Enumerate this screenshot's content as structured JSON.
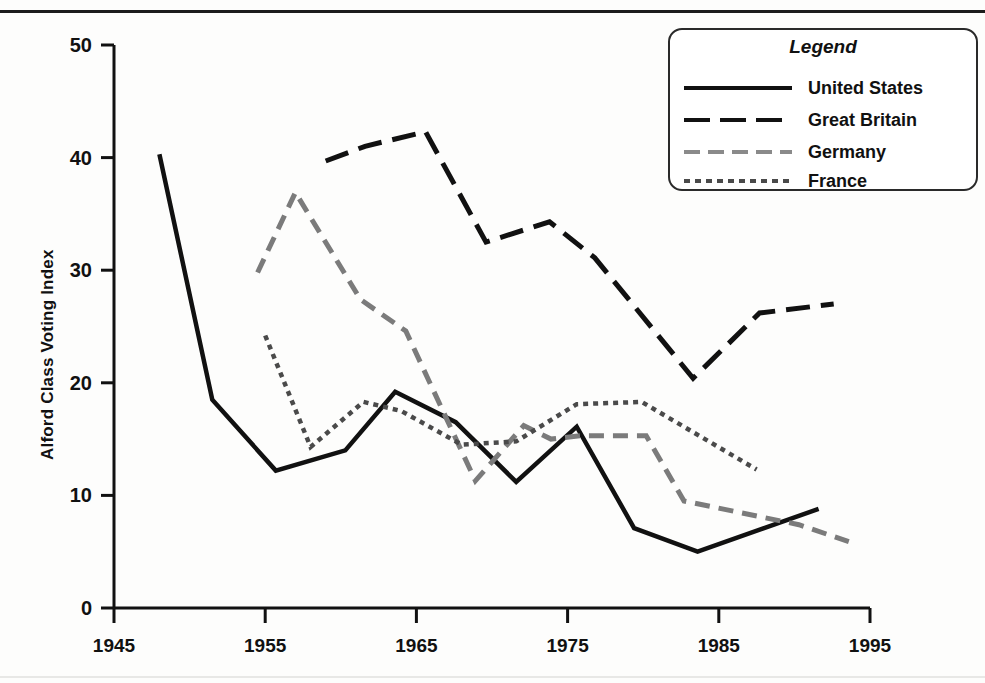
{
  "chart_data": {
    "type": "line",
    "title": "",
    "xlabel": "",
    "ylabel": "Alford Class Voting Index",
    "xlim": [
      1945,
      1995
    ],
    "ylim": [
      0,
      50
    ],
    "xticks": [
      1945,
      1955,
      1965,
      1975,
      1985,
      1995
    ],
    "yticks": [
      0,
      10,
      20,
      30,
      40,
      50
    ],
    "grid": false,
    "legend_position": "top-right",
    "legend_title": "Legend",
    "series": [
      {
        "name": "United States",
        "color": "#111111",
        "style": "solid",
        "points": [
          [
            1948.0,
            40.3
          ],
          [
            1951.5,
            18.5
          ],
          [
            1955.7,
            12.2
          ],
          [
            1960.3,
            14.0
          ],
          [
            1963.6,
            19.2
          ],
          [
            1967.6,
            16.5
          ],
          [
            1971.6,
            11.2
          ],
          [
            1975.6,
            16.1
          ],
          [
            1979.4,
            7.1
          ],
          [
            1983.6,
            5.0
          ],
          [
            1991.6,
            8.8
          ]
        ]
      },
      {
        "name": "Great Britain",
        "color": "#111111",
        "style": "long-dash",
        "points": [
          [
            1959.0,
            39.7
          ],
          [
            1961.6,
            41.0
          ],
          [
            1965.6,
            42.3
          ],
          [
            1969.6,
            32.5
          ],
          [
            1973.8,
            34.3
          ],
          [
            1976.8,
            31.1
          ],
          [
            1983.3,
            20.4
          ],
          [
            1987.7,
            26.2
          ],
          [
            1992.6,
            27.0
          ]
        ]
      },
      {
        "name": "Germany",
        "color": "#7b7b7b",
        "style": "dash",
        "points": [
          [
            1954.5,
            29.8
          ],
          [
            1957.0,
            36.9
          ],
          [
            1961.3,
            27.4
          ],
          [
            1964.3,
            24.6
          ],
          [
            1968.9,
            11.3
          ],
          [
            1972.1,
            16.2
          ],
          [
            1973.9,
            15.0
          ],
          [
            1975.9,
            15.3
          ],
          [
            1980.2,
            15.3
          ],
          [
            1982.7,
            9.5
          ],
          [
            1990.3,
            7.4
          ],
          [
            1993.6,
            5.9
          ]
        ]
      },
      {
        "name": "France",
        "color": "#4a4a4a",
        "style": "dot",
        "points": [
          [
            1955.0,
            24.2
          ],
          [
            1958.0,
            14.3
          ],
          [
            1961.5,
            18.3
          ],
          [
            1964.0,
            17.5
          ],
          [
            1968.0,
            14.5
          ],
          [
            1971.6,
            14.8
          ],
          [
            1975.6,
            18.1
          ],
          [
            1979.9,
            18.3
          ],
          [
            1987.5,
            12.3
          ]
        ]
      }
    ]
  },
  "axes": {
    "y_title": "Alford Class Voting Index",
    "y_ticks": [
      "0",
      "10",
      "20",
      "30",
      "40",
      "50"
    ],
    "x_ticks": [
      "1945",
      "1955",
      "1965",
      "1975",
      "1985",
      "1995"
    ]
  },
  "legend": {
    "title": "Legend",
    "items": [
      {
        "label": "United States",
        "style": "solid-line-icon"
      },
      {
        "label": "Great Britain",
        "style": "long-dash-line-icon"
      },
      {
        "label": "Germany",
        "style": "dash-line-icon"
      },
      {
        "label": "France",
        "style": "dotted-line-icon"
      }
    ]
  }
}
